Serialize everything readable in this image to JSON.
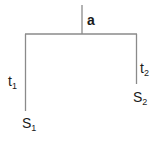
{
  "diagram": {
    "type": "tree",
    "root_label": "a",
    "branches": [
      {
        "edge_label": "t",
        "edge_subscript": "1",
        "leaf_label": "S",
        "leaf_subscript": "1",
        "side": "left"
      },
      {
        "edge_label": "t",
        "edge_subscript": "2",
        "leaf_label": "S",
        "leaf_subscript": "2",
        "side": "right"
      }
    ],
    "line_color": "#8a8a8a"
  }
}
